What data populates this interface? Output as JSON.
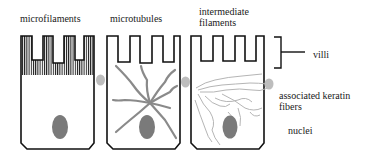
{
  "figure": {
    "cells": [
      {
        "label": "microfilaments"
      },
      {
        "label": "microtubules"
      },
      {
        "label_line1": "intermediate",
        "label_line2": "filaments"
      }
    ],
    "annotations": {
      "villi": "villi",
      "keratin_line1": "associated keratin",
      "keratin_line2": "fibers",
      "nuclei": "nuclei"
    },
    "colors": {
      "outline": "#111111",
      "nucleus": "#7a7a7a",
      "microtubule": "#8a8a8a",
      "keratin": "#b8b8b8",
      "junction": "#bdbdbd"
    }
  }
}
